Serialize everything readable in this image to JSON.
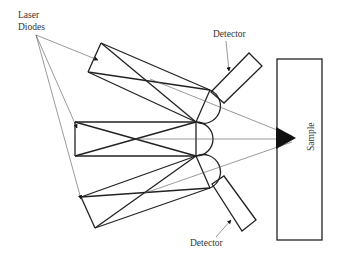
{
  "diagram": {
    "labels": {
      "laser_diodes_line1": "Laser",
      "laser_diodes_line2": "Diodes",
      "detector_top": "Detector",
      "detector_bottom": "Detector",
      "sample": "Sample"
    },
    "components": {
      "laser_modules": 3,
      "hemispherical_lenses": 3,
      "detectors": 2,
      "sample_box": 1
    },
    "colors": {
      "stroke": "#222222",
      "thin_stroke": "#555555",
      "text": "#333333",
      "background": "#ffffff"
    }
  }
}
